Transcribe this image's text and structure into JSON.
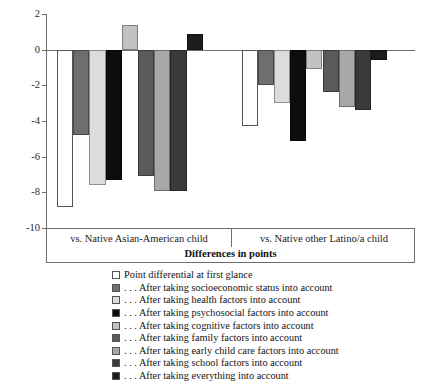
{
  "chart_data": {
    "type": "bar",
    "title": "",
    "subtitle": "",
    "xlabel": "Differences in points",
    "ylabel": "",
    "ylim": [
      -10,
      2
    ],
    "yticks": [
      2,
      0,
      -2,
      -4,
      -6,
      -8,
      -10
    ],
    "ytick_labels": [
      "2",
      "0",
      "-2",
      "-4",
      "-6",
      "-8",
      "-10"
    ],
    "grid": false,
    "legend_position": "bottom",
    "categories": [
      "vs. Native Asian-American child",
      "vs. Native other Latino/a child"
    ],
    "series": [
      {
        "name": "Point differential at first glance",
        "color": "#ffffff",
        "values": [
          -8.8,
          -4.3
        ]
      },
      {
        "name": ". . . After taking socioeconomic status into account",
        "color": "#6e6e6e",
        "values": [
          -4.8,
          -2.0
        ]
      },
      {
        "name": ". . . After taking health factors into account",
        "color": "#dcdcdc",
        "values": [
          -7.6,
          -3.0
        ]
      },
      {
        "name": ". . . After taking psychosocial factors into account",
        "color": "#0d0d0d",
        "values": [
          -7.3,
          -5.1
        ]
      },
      {
        "name": ". . . After taking cognitive factors into account",
        "color": "#c2c2c2",
        "values": [
          1.4,
          -1.1
        ]
      },
      {
        "name": ". . . After taking family factors into account",
        "color": "#5a5a5a",
        "values": [
          -7.1,
          -2.4
        ]
      },
      {
        "name": ". . . After taking early child care factors into account",
        "color": "#a8a8a8",
        "values": [
          -7.9,
          -3.2
        ]
      },
      {
        "name": ". . . After taking school factors into account",
        "color": "#3a3a3a",
        "values": [
          -7.9,
          -3.4
        ]
      },
      {
        "name": ". . . After taking everything into account",
        "color": "#1c1c1c",
        "values": [
          0.9,
          -0.6
        ]
      }
    ]
  },
  "axis": {
    "title": "Differences in points"
  }
}
